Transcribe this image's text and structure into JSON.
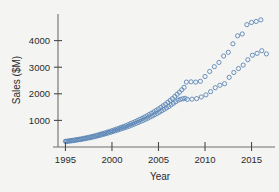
{
  "chart_data": {
    "type": "scatter",
    "title": "",
    "xlabel": "Year",
    "ylabel": "Sales ($M)",
    "xlim": [
      1994.2,
      2017.2
    ],
    "ylim": [
      0,
      5000
    ],
    "xticks": [
      1995,
      2000,
      2005,
      2010,
      2015
    ],
    "yticks": [
      1000,
      2000,
      3000,
      4000
    ],
    "xtick_labels": [
      "1995",
      "2000",
      "2005",
      "2010",
      "2015"
    ],
    "ytick_labels": [
      "1000",
      "2000",
      "3000",
      "4000"
    ],
    "grid": false,
    "legend": "none",
    "marker": "open-circle",
    "marker_color": "#5b86b5",
    "background_color": "#f4f4f2",
    "axis_color": "#6e6e6e",
    "series": [
      {
        "name": "Series A (upper branch)",
        "x": [
          1995.0,
          1995.25,
          1995.5,
          1995.75,
          1996.0,
          1996.25,
          1996.5,
          1996.75,
          1997.0,
          1997.25,
          1997.5,
          1997.75,
          1998.0,
          1998.25,
          1998.5,
          1998.75,
          1999.0,
          1999.25,
          1999.5,
          1999.75,
          2000.0,
          2000.25,
          2000.5,
          2000.75,
          2001.0,
          2001.25,
          2001.5,
          2001.75,
          2002.0,
          2002.25,
          2002.5,
          2002.75,
          2003.0,
          2003.25,
          2003.5,
          2003.75,
          2004.0,
          2004.25,
          2004.5,
          2004.75,
          2005.0,
          2005.25,
          2005.5,
          2005.75,
          2006.0,
          2006.25,
          2006.5,
          2006.75,
          2007.0,
          2007.25,
          2007.5,
          2007.75,
          2008.0,
          2008.5,
          2009.0,
          2009.5,
          2010.0,
          2010.5,
          2011.0,
          2011.5,
          2012.0,
          2012.5,
          2013.0,
          2013.5,
          2014.0,
          2014.5,
          2015.0,
          2015.5,
          2016.0
        ],
        "y": [
          215,
          225,
          240,
          250,
          265,
          280,
          295,
          310,
          330,
          345,
          365,
          385,
          405,
          430,
          455,
          480,
          505,
          530,
          560,
          585,
          615,
          645,
          675,
          705,
          740,
          770,
          805,
          840,
          880,
          915,
          955,
          995,
          1040,
          1080,
          1125,
          1170,
          1220,
          1270,
          1320,
          1375,
          1430,
          1490,
          1550,
          1610,
          1680,
          1750,
          1820,
          1900,
          1980,
          2060,
          2150,
          2240,
          2440,
          2450,
          2440,
          2470,
          2650,
          2840,
          3020,
          3180,
          3420,
          3560,
          3880,
          4180,
          4250,
          4600,
          4680,
          4720,
          4780
        ],
        "count": 69
      },
      {
        "name": "Series B (lower branch)",
        "x": [
          1995.1,
          1995.35,
          1995.6,
          1995.85,
          1996.1,
          1996.35,
          1996.6,
          1996.85,
          1997.1,
          1997.35,
          1997.6,
          1997.85,
          1998.1,
          1998.35,
          1998.6,
          1998.85,
          1999.1,
          1999.35,
          1999.6,
          1999.85,
          2000.1,
          2000.35,
          2000.6,
          2000.85,
          2001.1,
          2001.35,
          2001.6,
          2001.85,
          2002.1,
          2002.35,
          2002.6,
          2002.85,
          2003.1,
          2003.35,
          2003.6,
          2003.85,
          2004.1,
          2004.35,
          2004.6,
          2004.85,
          2005.1,
          2005.35,
          2005.6,
          2005.85,
          2006.1,
          2006.35,
          2006.6,
          2006.85,
          2007.1,
          2007.35,
          2007.6,
          2007.85,
          2008.1,
          2008.6,
          2009.1,
          2009.6,
          2010.1,
          2010.6,
          2011.1,
          2011.6,
          2012.1,
          2012.6,
          2013.1,
          2013.6,
          2014.1,
          2014.6,
          2015.1,
          2015.6,
          2016.1,
          2016.6
        ],
        "y": [
          205,
          215,
          228,
          238,
          252,
          266,
          280,
          295,
          312,
          328,
          346,
          364,
          384,
          406,
          428,
          452,
          476,
          500,
          526,
          552,
          580,
          606,
          634,
          662,
          694,
          722,
          752,
          784,
          820,
          852,
          888,
          924,
          964,
          1000,
          1040,
          1082,
          1126,
          1170,
          1215,
          1262,
          1310,
          1360,
          1412,
          1465,
          1520,
          1580,
          1640,
          1700,
          1760,
          1790,
          1810,
          1830,
          1790,
          1800,
          1820,
          1880,
          1960,
          2080,
          2230,
          2320,
          2380,
          2620,
          2800,
          2950,
          3080,
          3280,
          3450,
          3520,
          3620,
          3500
        ],
        "count": 70
      }
    ]
  }
}
